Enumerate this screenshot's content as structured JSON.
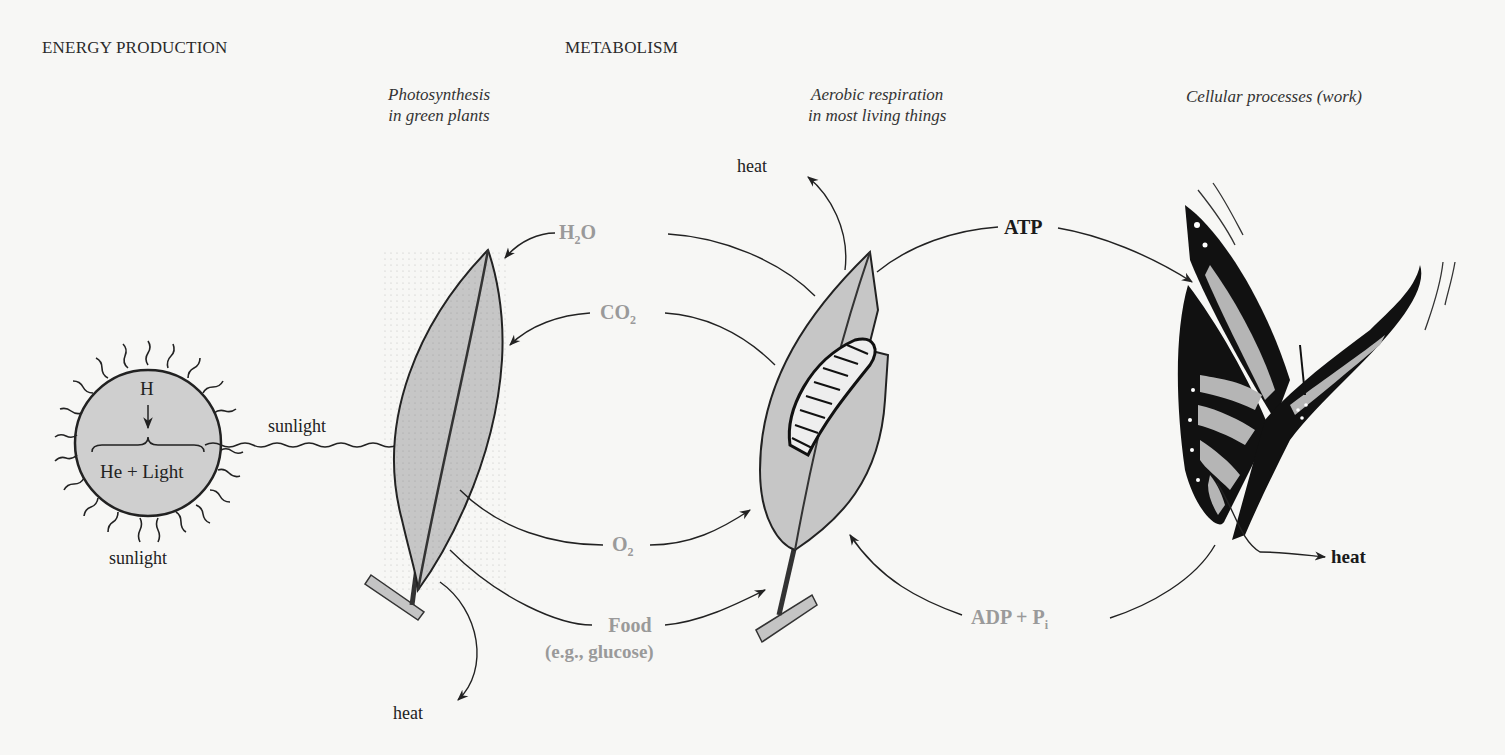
{
  "sections": {
    "energy_production": "ENERGY PRODUCTION",
    "metabolism": "METABOLISM"
  },
  "captions": {
    "photosynthesis_line1": "Photosynthesis",
    "photosynthesis_line2": "in green plants",
    "respiration_line1": "Aerobic respiration",
    "respiration_line2": "in most living things",
    "cellular": "Cellular processes (work)"
  },
  "sun": {
    "top_label": "H",
    "bottom_label": "He + Light",
    "below_label": "sunlight",
    "ray_label": "sunlight"
  },
  "flows": {
    "h2o": {
      "main": "H",
      "sub": "2",
      "tail": "O"
    },
    "co2": {
      "main": "CO",
      "sub": "2"
    },
    "o2": {
      "main": "O",
      "sub": "2"
    },
    "food_line1": "Food",
    "food_line2": "(e.g., glucose)",
    "atp": "ATP",
    "adp": {
      "main": "ADP + P",
      "sub": "i"
    }
  },
  "heat_labels": {
    "plant": "heat",
    "respiration": "heat",
    "butterfly": "heat"
  },
  "colors": {
    "background": "#f7f7f5",
    "fill_gray": "#c9c9c9",
    "label_gray": "#9a9a9a",
    "ink": "#1a1a1a"
  }
}
